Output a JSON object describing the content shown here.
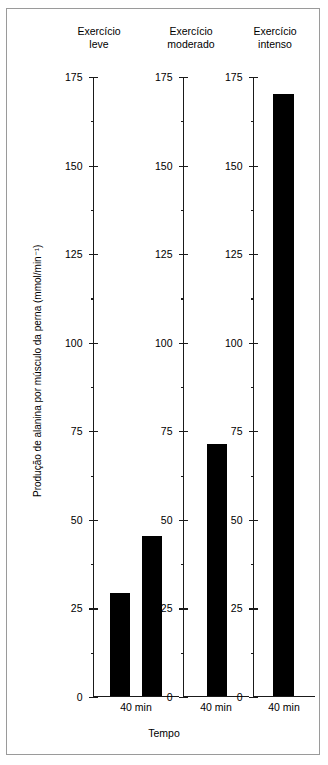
{
  "figure": {
    "y_axis_label": "Produção de alanina por músculo da perna (mmol/min⁻¹)",
    "x_axis_label": "Tempo"
  },
  "panels": [
    {
      "title": "Exercício\nleve",
      "x_tick_label": "40 min",
      "bars": [
        {
          "label": "bar-1",
          "value": 29
        },
        {
          "label": "bar-2",
          "value": 45
        }
      ]
    },
    {
      "title": "Exercício\nmoderado",
      "x_tick_label": "40 min",
      "bars": [
        {
          "label": "bar-1",
          "value": 71
        }
      ]
    },
    {
      "title": "Exercício\nintenso",
      "x_tick_label": "40 min",
      "bars": [
        {
          "label": "bar-1",
          "value": 170
        }
      ]
    }
  ],
  "axis": {
    "ticks": [
      {
        "value": 175,
        "label": "175"
      },
      {
        "value": 150,
        "label": "150"
      },
      {
        "value": 125,
        "label": "125"
      },
      {
        "value": 100,
        "label": "100"
      },
      {
        "value": 75,
        "label": "75"
      },
      {
        "value": 50,
        "label": "50"
      },
      {
        "value": 25,
        "label": "25"
      },
      {
        "value": 0,
        "label": "0"
      }
    ],
    "minor_ticks": [
      162.5,
      137.5,
      112.5,
      87.5,
      62.5,
      37.5,
      12.5
    ]
  },
  "chart_data": {
    "type": "bar",
    "title": "",
    "subtitle": "",
    "xlabel": "Tempo",
    "ylabel": "Produção de alanina por músculo da perna (mmol/min⁻¹)",
    "ylim": [
      0,
      175
    ],
    "ytick_values": [
      0,
      25,
      50,
      75,
      100,
      125,
      150,
      175
    ],
    "ytick_labels": [
      "0",
      "25",
      "50",
      "75",
      "100",
      "125",
      "150",
      "175"
    ],
    "grid": false,
    "legend": null,
    "panels": [
      {
        "name": "Exercício leve",
        "categories": [
          "40 min",
          "40 min"
        ],
        "values": [
          29,
          45
        ]
      },
      {
        "name": "Exercício moderado",
        "categories": [
          "40 min"
        ],
        "values": [
          71
        ]
      },
      {
        "name": "Exercício intenso",
        "categories": [
          "40 min"
        ],
        "values": [
          170
        ]
      }
    ],
    "bar_color": "#000000",
    "axis_color": "#000000",
    "background": "#ffffff"
  }
}
